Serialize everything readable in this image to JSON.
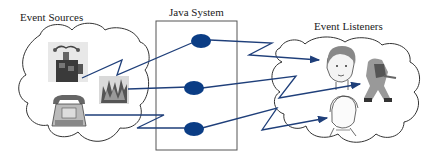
{
  "diagram": {
    "groups": {
      "sources": {
        "label": "Event Sources"
      },
      "system": {
        "label": "Java System"
      },
      "listeners": {
        "label": "Event Listeners"
      }
    },
    "sources": [
      {
        "id": "jack-in-the-box",
        "icon": "jack-in-the-box-icon"
      },
      {
        "id": "fire",
        "icon": "fire-icon"
      },
      {
        "id": "telephone",
        "icon": "telephone-icon"
      }
    ],
    "handlers": [
      {
        "id": "handler-1"
      },
      {
        "id": "handler-2"
      },
      {
        "id": "handler-3"
      }
    ],
    "listeners": [
      {
        "id": "boy",
        "icon": "boy-face-icon"
      },
      {
        "id": "firefighter",
        "icon": "firefighter-icon"
      },
      {
        "id": "woman",
        "icon": "woman-face-icon"
      }
    ],
    "connections": [
      {
        "from": "jack-in-the-box",
        "to": "handler-1"
      },
      {
        "from": "handler-1",
        "to": "boy"
      },
      {
        "from": "fire",
        "to": "handler-2"
      },
      {
        "from": "handler-2",
        "to": "firefighter"
      },
      {
        "from": "telephone",
        "to": "handler-3"
      },
      {
        "from": "handler-3",
        "to": "woman"
      }
    ],
    "colors": {
      "line": "#1f3f7a",
      "handler": "#0b3d85",
      "outline": "#333333"
    }
  }
}
